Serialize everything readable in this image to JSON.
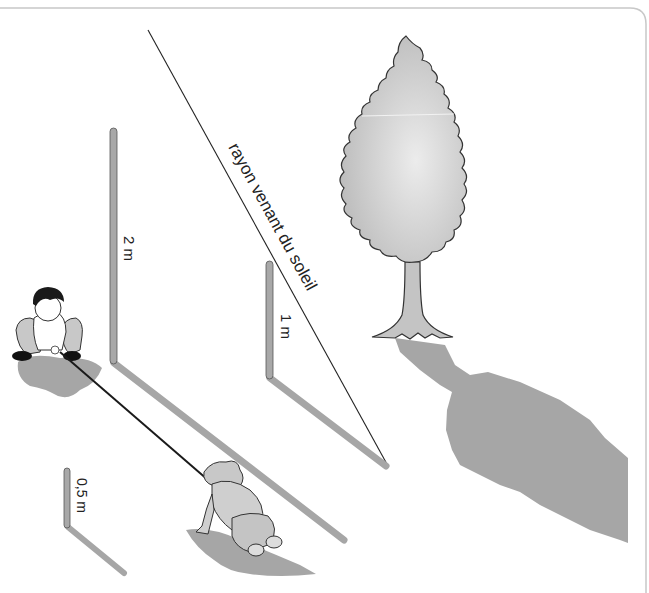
{
  "figure": {
    "sun_ray_label": "rayon venant du soleil",
    "sticks": [
      {
        "id": "stick-2m",
        "label": "2 m"
      },
      {
        "id": "stick-1m",
        "label": "1 m"
      },
      {
        "id": "stick-05m",
        "label": "0,5 m"
      }
    ]
  },
  "colors": {
    "background": "#ffffff",
    "frame": "#c8c8c8",
    "stick_fill": "#a8a8a8",
    "shadow": "#a6a6a6",
    "tree_fill": "#c9c9c9",
    "outline": "#333333",
    "ray": "#222222",
    "rope": "#1a1a1a"
  }
}
